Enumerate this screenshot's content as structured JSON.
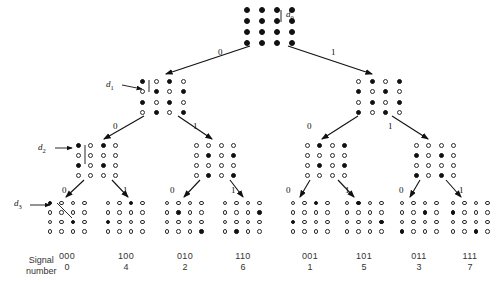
{
  "figure": {
    "type": "binary-tree-diagram",
    "grid_size": 4
  },
  "caption": {
    "line1": "Signal",
    "line2": "number"
  },
  "distance_labels": [
    {
      "id": "d0",
      "text": "d",
      "sub": "0"
    },
    {
      "id": "d1",
      "text": "d",
      "sub": "1"
    },
    {
      "id": "d2",
      "text": "d",
      "sub": "2"
    },
    {
      "id": "d3",
      "text": "d",
      "sub": "3"
    }
  ],
  "edge_labels": {
    "level1": [
      {
        "value": "0",
        "x": 218,
        "y": 48
      },
      {
        "value": "1",
        "x": 331,
        "y": 48
      }
    ],
    "level2": [
      {
        "value": "0",
        "x": 113,
        "y": 122
      },
      {
        "value": "1",
        "x": 193,
        "y": 122
      },
      {
        "value": "0",
        "x": 307,
        "y": 122
      },
      {
        "value": "1",
        "x": 388,
        "y": 122
      }
    ],
    "level3": [
      {
        "value": "0",
        "x": 62,
        "y": 186
      },
      {
        "value": "1",
        "x": 123,
        "y": 186
      },
      {
        "value": "0",
        "x": 170,
        "y": 186
      },
      {
        "value": "1",
        "x": 231,
        "y": 186
      },
      {
        "value": "0",
        "x": 286,
        "y": 186
      },
      {
        "value": "1",
        "x": 345,
        "y": 186
      },
      {
        "value": "0",
        "x": 399,
        "y": 186
      },
      {
        "value": "1",
        "x": 459,
        "y": 186
      }
    ]
  },
  "nodes": {
    "level0": {
      "name": "root-node",
      "x": 239,
      "y": 4,
      "pattern": [
        [
          1,
          1,
          1,
          1
        ],
        [
          1,
          1,
          1,
          1
        ],
        [
          1,
          1,
          1,
          1
        ],
        [
          1,
          1,
          1,
          1
        ]
      ]
    },
    "level1": [
      {
        "name": "node-0",
        "x": 136,
        "y": 76,
        "pattern": [
          [
            1,
            0,
            1,
            0
          ],
          [
            0,
            1,
            0,
            1
          ],
          [
            1,
            0,
            1,
            0
          ],
          [
            0,
            1,
            0,
            1
          ]
        ]
      },
      {
        "name": "node-1",
        "x": 352,
        "y": 76,
        "pattern": [
          [
            0,
            1,
            0,
            1
          ],
          [
            1,
            0,
            1,
            0
          ],
          [
            0,
            1,
            0,
            1
          ],
          [
            1,
            0,
            1,
            0
          ]
        ]
      }
    ],
    "level2": [
      {
        "name": "node-00",
        "x": 72,
        "y": 140,
        "pattern": [
          [
            1,
            0,
            1,
            0
          ],
          [
            0,
            0,
            0,
            0
          ],
          [
            1,
            0,
            1,
            0
          ],
          [
            0,
            0,
            0,
            0
          ]
        ]
      },
      {
        "name": "node-01",
        "x": 190,
        "y": 140,
        "pattern": [
          [
            0,
            0,
            0,
            0
          ],
          [
            0,
            1,
            0,
            1
          ],
          [
            0,
            0,
            0,
            0
          ],
          [
            0,
            1,
            0,
            1
          ]
        ]
      },
      {
        "name": "node-10",
        "x": 301,
        "y": 140,
        "pattern": [
          [
            0,
            1,
            0,
            1
          ],
          [
            0,
            0,
            0,
            0
          ],
          [
            0,
            1,
            0,
            1
          ],
          [
            0,
            0,
            0,
            0
          ]
        ]
      },
      {
        "name": "node-11",
        "x": 410,
        "y": 140,
        "pattern": [
          [
            0,
            0,
            0,
            0
          ],
          [
            1,
            0,
            1,
            0
          ],
          [
            0,
            0,
            0,
            0
          ],
          [
            1,
            0,
            1,
            0
          ]
        ]
      }
    ],
    "level3": [
      {
        "name": "leaf-000",
        "x": 44,
        "y": 198,
        "pattern": [
          [
            1,
            0,
            0,
            0
          ],
          [
            0,
            0,
            0,
            0
          ],
          [
            0,
            0,
            1,
            0
          ],
          [
            0,
            0,
            0,
            0
          ]
        ]
      },
      {
        "name": "leaf-100",
        "x": 102,
        "y": 198,
        "pattern": [
          [
            0,
            0,
            1,
            0
          ],
          [
            0,
            0,
            0,
            0
          ],
          [
            1,
            0,
            0,
            0
          ],
          [
            0,
            0,
            0,
            0
          ]
        ]
      },
      {
        "name": "leaf-010",
        "x": 161,
        "y": 198,
        "pattern": [
          [
            0,
            0,
            0,
            0
          ],
          [
            0,
            1,
            0,
            0
          ],
          [
            0,
            0,
            0,
            0
          ],
          [
            0,
            0,
            0,
            1
          ]
        ]
      },
      {
        "name": "leaf-110",
        "x": 219,
        "y": 198,
        "pattern": [
          [
            0,
            0,
            0,
            0
          ],
          [
            0,
            0,
            0,
            1
          ],
          [
            0,
            0,
            0,
            0
          ],
          [
            0,
            1,
            0,
            0
          ]
        ]
      },
      {
        "name": "leaf-001",
        "x": 287,
        "y": 198,
        "pattern": [
          [
            0,
            0,
            1,
            0
          ],
          [
            0,
            0,
            0,
            0
          ],
          [
            1,
            0,
            0,
            0
          ],
          [
            0,
            0,
            0,
            0
          ]
        ]
      },
      {
        "name": "leaf-101",
        "x": 341,
        "y": 198,
        "pattern": [
          [
            0,
            1,
            0,
            0
          ],
          [
            0,
            0,
            0,
            0
          ],
          [
            0,
            0,
            0,
            1
          ],
          [
            0,
            0,
            0,
            0
          ]
        ]
      },
      {
        "name": "leaf-011",
        "x": 396,
        "y": 198,
        "pattern": [
          [
            0,
            0,
            0,
            0
          ],
          [
            0,
            0,
            1,
            0
          ],
          [
            0,
            0,
            0,
            0
          ],
          [
            1,
            0,
            0,
            0
          ]
        ]
      },
      {
        "name": "leaf-111",
        "x": 447,
        "y": 198,
        "pattern": [
          [
            0,
            0,
            0,
            0
          ],
          [
            1,
            0,
            0,
            0
          ],
          [
            0,
            0,
            0,
            0
          ],
          [
            0,
            0,
            1,
            0
          ]
        ]
      }
    ]
  },
  "signal_columns": [
    {
      "code": "000",
      "number": "0",
      "x": 41
    },
    {
      "code": "100",
      "number": "4",
      "x": 100
    },
    {
      "code": "010",
      "number": "2",
      "x": 159
    },
    {
      "code": "110",
      "number": "6",
      "x": 217
    },
    {
      "code": "001",
      "number": "1",
      "x": 284
    },
    {
      "code": "101",
      "number": "5",
      "x": 338
    },
    {
      "code": "011",
      "number": "3",
      "x": 393
    },
    {
      "code": "111",
      "number": "7",
      "x": 444
    }
  ]
}
